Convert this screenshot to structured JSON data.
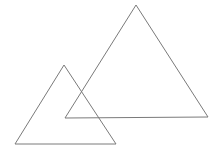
{
  "diagram": {
    "background_color": "#ffffff",
    "stroke_color": "#7a7a7a",
    "shapes": [
      {
        "id": "large-triangle",
        "type": "triangle",
        "label": "",
        "relative_size": "large",
        "position": "upper-right"
      },
      {
        "id": "small-triangle",
        "type": "triangle",
        "label": "",
        "relative_size": "small",
        "position": "lower-left"
      }
    ],
    "relationship": "overlapping"
  }
}
